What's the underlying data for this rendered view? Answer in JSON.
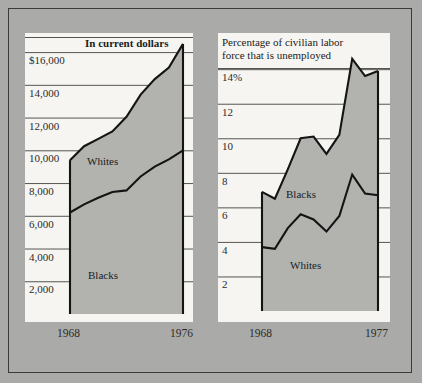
{
  "figure": {
    "background_color": "#aaaaa8",
    "panel_color": "#f6f5f1",
    "fill_color": "#b2b2ae",
    "line_color": "#141414",
    "grid_color": "#555552",
    "border_color": "#3a3a38"
  },
  "chart_data": [
    {
      "id": "income",
      "type": "area",
      "title": "In current dollars",
      "title_bold": true,
      "xlabel": "",
      "ylabel": "",
      "grid": true,
      "legend_position": "inline",
      "x": [
        1968,
        1969,
        1970,
        1971,
        1972,
        1973,
        1974,
        1975,
        1976
      ],
      "xlim": [
        1968,
        1976
      ],
      "ylim": [
        0,
        16800
      ],
      "xticks": [
        1968,
        1976
      ],
      "xtick_labels": [
        "1968",
        "1976"
      ],
      "yticks": [
        2000,
        4000,
        6000,
        8000,
        10000,
        12000,
        14000,
        16000
      ],
      "ytick_labels": [
        "2,000",
        "4,000",
        "6,000",
        "8,000",
        "10,000",
        "12,000",
        "14,000",
        "$16,000"
      ],
      "series": [
        {
          "name": "Whites",
          "label": "Whites",
          "values": [
            9400,
            10250,
            10700,
            11150,
            12050,
            13400,
            14350,
            15050,
            16500
          ]
        },
        {
          "name": "Blacks",
          "label": "Blacks",
          "values": [
            6200,
            6700,
            7100,
            7450,
            7550,
            8400,
            9000,
            9450,
            10000
          ]
        }
      ]
    },
    {
      "id": "unemployment",
      "type": "area",
      "title": "Percentage of civilian labor\nforce that is unemployed",
      "title_bold": false,
      "xlabel": "",
      "ylabel": "",
      "grid": true,
      "legend_position": "inline",
      "x": [
        1968,
        1969,
        1970,
        1971,
        1972,
        1973,
        1974,
        1975,
        1976,
        1977
      ],
      "xlim": [
        1968,
        1977
      ],
      "ylim": [
        0,
        15.4
      ],
      "xticks": [
        1968,
        1977
      ],
      "xtick_labels": [
        "1968",
        "1977"
      ],
      "yticks": [
        2,
        4,
        6,
        8,
        10,
        12,
        14
      ],
      "ytick_labels": [
        "2",
        "4",
        "6",
        "8",
        "10",
        "12",
        "14%"
      ],
      "series": [
        {
          "name": "Blacks",
          "label": "Blacks",
          "values": [
            6.9,
            6.5,
            8.2,
            10.0,
            10.1,
            9.1,
            10.2,
            14.6,
            13.6,
            13.9
          ]
        },
        {
          "name": "Whites",
          "label": "Whites",
          "values": [
            3.7,
            3.6,
            4.8,
            5.6,
            5.3,
            4.6,
            5.5,
            7.9,
            6.8,
            6.7
          ]
        }
      ]
    }
  ]
}
